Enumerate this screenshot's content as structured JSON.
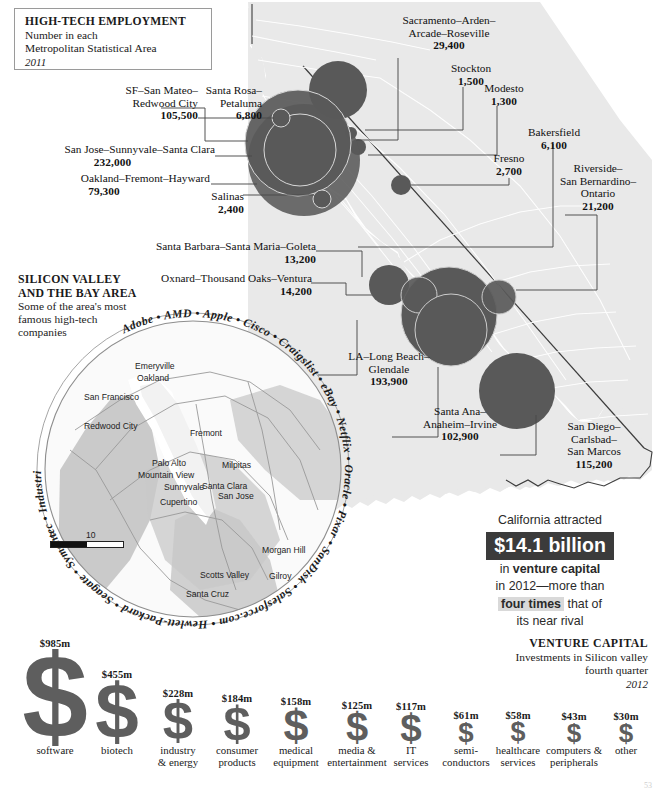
{
  "title_box": {
    "heading": "HIGH-TECH EMPLOYMENT",
    "line2": "Number in each",
    "line3": "Metropolitan Statistical Area",
    "year": "2011"
  },
  "colors": {
    "bubble": "#595959",
    "land": "#e9e9e9",
    "land_border": "#3c3c3c",
    "dollar_glyph": "#5e5e5e",
    "vc_highlight_bg": "#3b3b3b",
    "vc_inline_highlight": "#d9d9d9"
  },
  "msa_labels": [
    {
      "name": "sf-san-mateo-redwood-city",
      "lines": [
        "SF–San Mateo–",
        "Redwood City"
      ],
      "value": "105,500"
    },
    {
      "name": "santa-rosa-petaluma",
      "lines": [
        "Santa Rosa–",
        "Petaluma"
      ],
      "value": "6,800"
    },
    {
      "name": "san-jose-sunnyvale-santa-clara",
      "lines": [
        "San Jose–Sunnyvale–Santa Clara"
      ],
      "value": "232,000"
    },
    {
      "name": "oakland-fremont-hayward",
      "lines": [
        "Oakland–Fremont–Hayward"
      ],
      "value": "79,300"
    },
    {
      "name": "salinas",
      "lines": [
        "Salinas"
      ],
      "value": "2,400"
    },
    {
      "name": "santa-barbara-santa-maria-goleta",
      "lines": [
        "Santa Barbara–Santa Maria–Goleta"
      ],
      "value": "13,200"
    },
    {
      "name": "oxnard-thousand-oaks-ventura",
      "lines": [
        "Oxnard–Thousand Oaks–Ventura"
      ],
      "value": "14,200"
    },
    {
      "name": "sacramento-arden-arcade-roseville",
      "lines": [
        "Sacramento–Arden–",
        "Arcade–Roseville"
      ],
      "value": "29,400"
    },
    {
      "name": "stockton",
      "lines": [
        "Stockton"
      ],
      "value": "1,500"
    },
    {
      "name": "modesto",
      "lines": [
        "Modesto"
      ],
      "value": "1,300"
    },
    {
      "name": "bakersfield",
      "lines": [
        "Bakersfield"
      ],
      "value": "6,100"
    },
    {
      "name": "fresno",
      "lines": [
        "Fresno"
      ],
      "value": "2,700"
    },
    {
      "name": "riverside-san-bernardino-ontario",
      "lines": [
        "Riverside–",
        "San Bernardino–",
        "Ontario"
      ],
      "value": "21,200"
    },
    {
      "name": "la-long-beach-glendale",
      "lines": [
        "LA–Long Beach–",
        "Glendale"
      ],
      "value": "193,900"
    },
    {
      "name": "santa-ana-anaheim-irvine",
      "lines": [
        "Santa Ana–",
        "Anaheim–Irvine"
      ],
      "value": "102,900"
    },
    {
      "name": "san-diego-carlsbad-san-marcos",
      "lines": [
        "San Diego–",
        "Carlsbad–",
        "San Marcos"
      ],
      "value": "115,200"
    }
  ],
  "silicon_valley": {
    "heading_line1": "SILICON VALLEY",
    "heading_line2": "AND THE BAY AREA",
    "sub_line1": "Some of the area's most",
    "sub_line2": "famous high-tech",
    "sub_line3": "companies",
    "companies": [
      "Adobe",
      "AMD",
      "Apple",
      "Cisco",
      "Craigslist",
      "eBay",
      "Netflix",
      "Oracle",
      "Pixar",
      "SanDisk",
      "Salesforce.com",
      "Electronic Arts",
      "Facebook",
      "Google",
      "Hewlett-Packard",
      "Seagate",
      "Symantec",
      "Industrial Light & Magic",
      "Twitter",
      "Wikipedia",
      "Intel",
      "Yahoo",
      "Juniper Networks",
      "Intuit",
      "LinkedIn"
    ],
    "ring_text": "Adobe • AMD • Apple • Cisco • Craigslist • eBay • Netflix • Oracle • Pixar • SanDisk • Salesforce.com • Hewlett-Packard • Seagate • Symantec • Industrial Light & Magic • Twitter • Wikipedia • Intel • Yahoo • Intuit • Juniper Networks • LinkedIn",
    "ring_upper": "• Electronic Arts • Facebook • Google •",
    "cities": [
      "San Francisco",
      "Emeryville",
      "Oakland",
      "Redwood City",
      "Fremont",
      "Palo Alto",
      "Milpitas",
      "Mountain View",
      "Sunnyvale",
      "Santa Clara",
      "San Jose",
      "Cupertino",
      "Morgan Hill",
      "Scotts Valley",
      "Gilroy",
      "Santa Cruz"
    ],
    "scale_zero": "0",
    "scale_label": "10 miles"
  },
  "vc_callout": {
    "line1": "California attracted",
    "big": "$14.1 billion",
    "line2_pre": "in ",
    "line2_bold": "venture capital",
    "line3": "in 2012—more than",
    "line4_hl": "four times",
    "line4_post": " that of",
    "line5": "its near rival"
  },
  "vc_header": {
    "heading": "VENTURE CAPITAL",
    "sub": "Investments in Silicon valley",
    "sub2": "fourth quarter",
    "year": "2012"
  },
  "chart_data": {
    "type": "bar",
    "title": "VENTURE CAPITAL",
    "subtitle": "Investments in Silicon valley, fourth quarter 2012",
    "xlabel": "",
    "ylabel": "Investment ($ millions)",
    "unit": "$m",
    "categories": [
      "software",
      "biotech",
      "industry & energy",
      "consumer products",
      "medical equipment",
      "media & entertainment",
      "IT services",
      "semiconductors",
      "healthcare services",
      "computers & peripherals",
      "other"
    ],
    "values": [
      985,
      455,
      228,
      184,
      158,
      125,
      117,
      61,
      58,
      43,
      30
    ],
    "labels": [
      "$985m",
      "$455m",
      "$228m",
      "$184m",
      "$158m",
      "$125m",
      "$117m",
      "$61m",
      "$58m",
      "$43m",
      "$30m"
    ],
    "ylim": [
      0,
      985
    ],
    "grid": false,
    "legend": null
  },
  "bar_items": [
    {
      "label": "$985m",
      "value": 985,
      "cap1": "software",
      "cap2": ""
    },
    {
      "label": "$455m",
      "value": 455,
      "cap1": "biotech",
      "cap2": ""
    },
    {
      "label": "$228m",
      "value": 228,
      "cap1": "industry",
      "cap2": "& energy"
    },
    {
      "label": "$184m",
      "value": 184,
      "cap1": "consumer",
      "cap2": "products"
    },
    {
      "label": "$158m",
      "value": 158,
      "cap1": "medical",
      "cap2": "equipment"
    },
    {
      "label": "$125m",
      "value": 125,
      "cap1": "media &",
      "cap2": "entertainment"
    },
    {
      "label": "$117m",
      "value": 117,
      "cap1": "IT",
      "cap2": "services"
    },
    {
      "label": "$61m",
      "value": 61,
      "cap1": "semi-",
      "cap2": "conductors"
    },
    {
      "label": "$58m",
      "value": 58,
      "cap1": "healthcare",
      "cap2": "services"
    },
    {
      "label": "$43m",
      "value": 43,
      "cap1": "computers &",
      "cap2": "peripherals"
    },
    {
      "label": "$30m",
      "value": 30,
      "cap1": "other",
      "cap2": ""
    }
  ],
  "dollar_glyph": "$",
  "page_number": "53"
}
